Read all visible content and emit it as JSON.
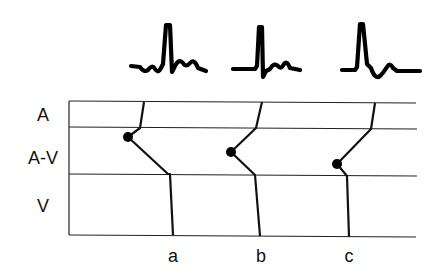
{
  "diagram": {
    "type": "ladder-diagram",
    "tiers": [
      {
        "label": "A"
      },
      {
        "label": "A-V"
      },
      {
        "label": "V"
      }
    ],
    "beats": [
      {
        "label": "a",
        "ecg_icon": "qrs-complex-wide-icon"
      },
      {
        "label": "b",
        "ecg_icon": "qrs-complex-narrow-icon"
      },
      {
        "label": "c",
        "ecg_icon": "qrs-complex-inverted-t-icon"
      }
    ],
    "colors": {
      "line": "#222222",
      "background": "#ffffff"
    }
  }
}
